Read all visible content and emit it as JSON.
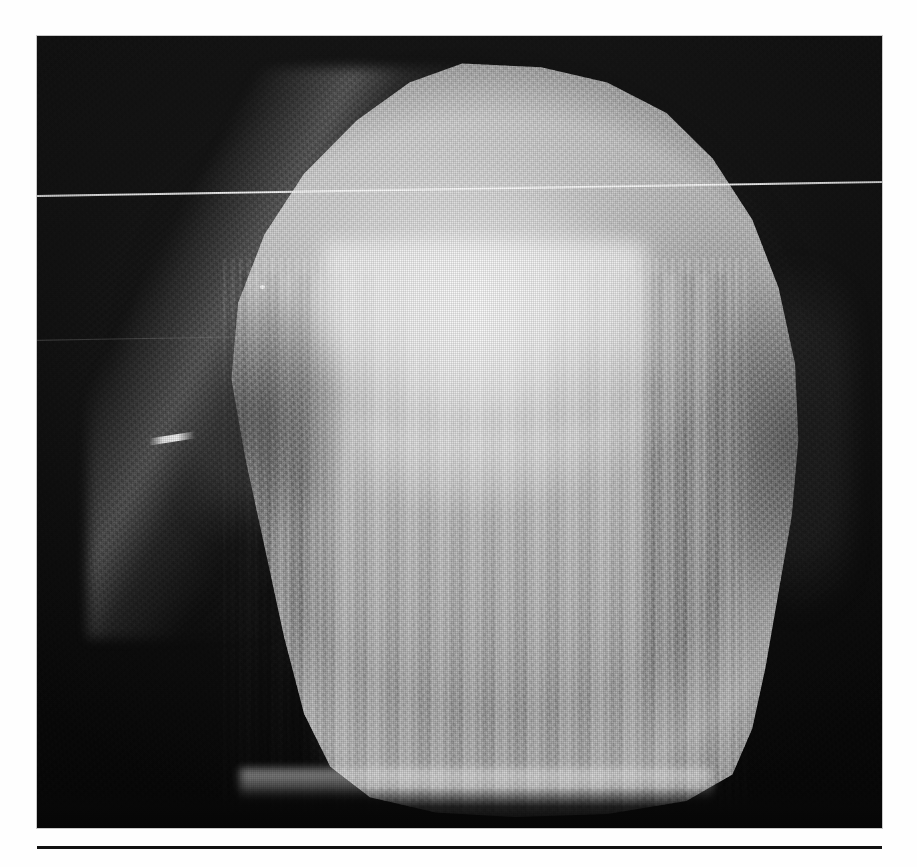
{
  "figure": {
    "kind": "radiograph",
    "modality": "plain-film radiograph",
    "plate": {
      "left_px": 37,
      "top_px": 36,
      "width_px": 845,
      "height_px": 792
    },
    "colors": {
      "page_background": "#fefefe",
      "film_background": "#0a0a0a",
      "bone_midtone": "#cfcfcf",
      "bone_highlight": "#f6f6f6",
      "bone_shadow": "#8c8c8c",
      "rule": "#111111",
      "caption_text": "#121212"
    },
    "artifacts": [
      {
        "name": "scan-line",
        "description": "Thin bright horizontal scanner line crossing the full plate width, sloping slightly upward to the right."
      },
      {
        "name": "scan-line-faint",
        "description": "Fainter partial parallel line across the left third of the plate."
      },
      {
        "name": "metal-artifact",
        "description": "Small bright elongated opacity near the left margin at mid-height."
      },
      {
        "name": "bright-speck",
        "description": "Tiny punctate bright speck in the mid-left field."
      }
    ],
    "regions": [
      {
        "name": "superior-dome",
        "description": "Rounded superior cortical dome of the specimen."
      },
      {
        "name": "dense-core",
        "description": "Hyper-dense bright central column of trabecular bone."
      },
      {
        "name": "vertical-trabeculae",
        "description": "Prominent vertically oriented trabecular striations in the trunk."
      },
      {
        "name": "medial-notch",
        "description": "Darker notch along the left (medial) border."
      },
      {
        "name": "lateral-shadow",
        "description": "Darker soft-tissue shadow along the right (lateral) border."
      },
      {
        "name": "inferior-cut-edge",
        "description": "Bright inferior cut margin of the specimen."
      }
    ]
  },
  "caption": {
    "rule_visible": true,
    "text": "",
    "note": "Caption line is cropped at the bottom page edge; only the tops of ascender letters are visible."
  }
}
